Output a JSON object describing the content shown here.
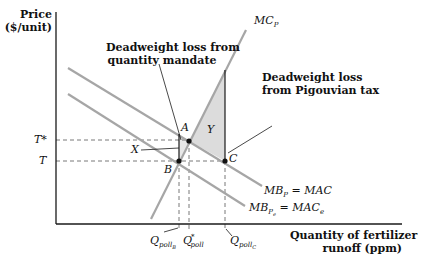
{
  "axes": {
    "y_label_line1": "Price",
    "y_label_line2": "($/unit)",
    "x_label_line1": "Quantity of fertilizer",
    "x_label_line2": "runoff (ppm)"
  },
  "price_levels": {
    "t_star": "T*",
    "t": "T"
  },
  "curves": {
    "mc": {
      "base": "MC",
      "sub": "P"
    },
    "mb_upper": {
      "text": "MB",
      "sub": "P",
      "rhs": "= MAC"
    },
    "mb_lower": {
      "text": "MB",
      "sub": "P",
      "subsub": "e",
      "rhs": "= MAC",
      "rhs_sub": "e"
    }
  },
  "points": {
    "a": "A",
    "b": "B",
    "c": "C",
    "x": "X",
    "y": "Y"
  },
  "quantities": {
    "q_b": {
      "base": "Q",
      "sub": "poll",
      "subsub": "B"
    },
    "q_star": {
      "base": "Q",
      "sup": "*",
      "sub": "poll"
    },
    "q_c": {
      "base": "Q",
      "sub": "poll",
      "subsub": "C"
    }
  },
  "annotations": {
    "mandate_line1": "Deadweight loss from",
    "mandate_line2": "quantity mandate",
    "tax_line1": "Deadweight loss",
    "tax_line2": "from Pigouvian tax"
  },
  "colors": {
    "curve": "#a6a6a6",
    "axis": "#1a1a1a",
    "shade": "#dcdcdc"
  }
}
